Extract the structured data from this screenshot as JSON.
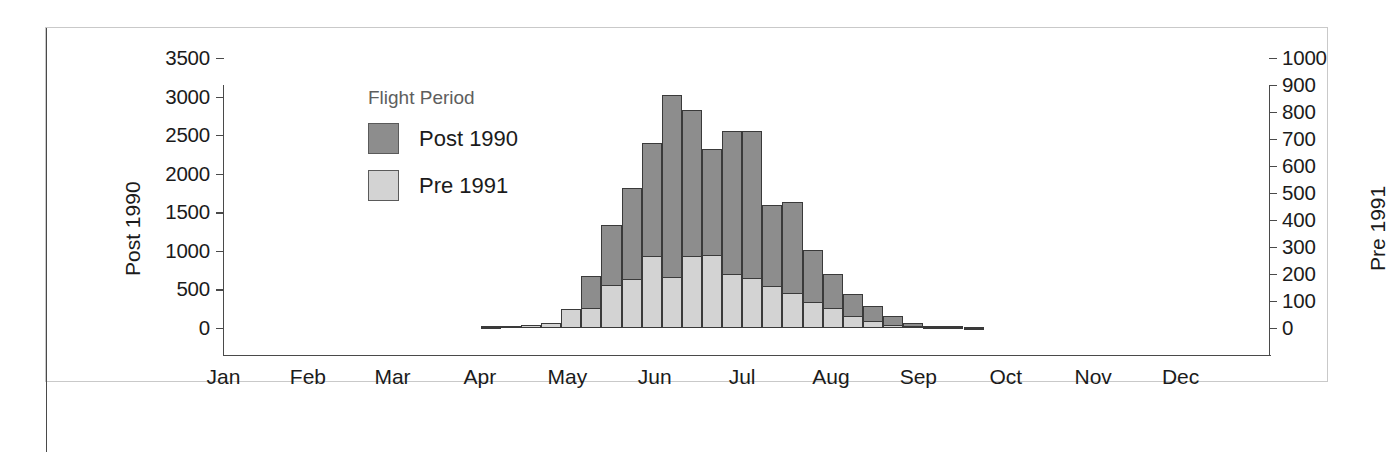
{
  "chart_data": {
    "type": "bar",
    "title": "",
    "subtitle": "",
    "legend": {
      "title": "Flight Period",
      "position": "inside-top-left",
      "entries": [
        {
          "name": "Post 1990",
          "color": "#8d8d8d"
        },
        {
          "name": "Pre 1991",
          "color": "#d3d3d3"
        }
      ]
    },
    "xlabel": "",
    "x_tick_labels": [
      "Jan",
      "Feb",
      "Mar",
      "Apr",
      "May",
      "Jun",
      "Jul",
      "Aug",
      "Sep",
      "Oct",
      "Nov",
      "Dec"
    ],
    "x_tick_count": 52,
    "grid": false,
    "axes": [
      {
        "side": "left",
        "label": "Post 1990",
        "ylim": [
          0,
          3500
        ],
        "ticks": [
          0,
          500,
          1000,
          1500,
          2000,
          2500,
          3000,
          3500
        ],
        "tick_labels": [
          "0",
          "500",
          "1000",
          "1500",
          "2000",
          "2500",
          "3000",
          "3500"
        ]
      },
      {
        "side": "right",
        "label": "Pre 1991",
        "ylim": [
          0,
          1000
        ],
        "ticks": [
          0,
          100,
          200,
          300,
          400,
          500,
          600,
          700,
          800,
          900,
          1000
        ],
        "tick_labels": [
          "0",
          "100",
          "200",
          "300",
          "400",
          "500",
          "600",
          "700",
          "800",
          "900",
          "1000"
        ]
      }
    ],
    "x": [
      "w1",
      "w2",
      "w3",
      "w4",
      "w5",
      "w6",
      "w7",
      "w8",
      "w9",
      "w10",
      "w11",
      "w12",
      "w13",
      "w14",
      "w15",
      "w16",
      "w17",
      "w18",
      "w19",
      "w20",
      "w21",
      "w22",
      "w23",
      "w24",
      "w25",
      "w26",
      "w27",
      "w28",
      "w29",
      "w30",
      "w31",
      "w32",
      "w33",
      "w34",
      "w35",
      "w36",
      "w37",
      "w38",
      "w39",
      "w40",
      "w41",
      "w42",
      "w43",
      "w44",
      "w45",
      "w46",
      "w47",
      "w48",
      "w49",
      "w50",
      "w51",
      "w52"
    ],
    "series": [
      {
        "name": "Post 1990",
        "axis": "left",
        "color": "#8d8d8d",
        "values": [
          0,
          0,
          0,
          0,
          0,
          0,
          0,
          0,
          0,
          0,
          0,
          0,
          0,
          0,
          0,
          25,
          30,
          40,
          60,
          240,
          680,
          1340,
          1810,
          2400,
          3020,
          2820,
          2320,
          2560,
          2560,
          1600,
          1630,
          1010,
          700,
          440,
          290,
          150,
          60,
          30,
          20,
          10,
          0,
          0,
          0,
          0,
          0,
          0,
          0,
          0,
          0,
          0,
          0,
          0
        ]
      },
      {
        "name": "Pre 1991",
        "axis": "right",
        "color": "#d3d3d3",
        "values": [
          0,
          0,
          0,
          0,
          0,
          0,
          0,
          0,
          0,
          0,
          0,
          0,
          0,
          0,
          0,
          5,
          8,
          12,
          18,
          70,
          75,
          160,
          180,
          265,
          190,
          265,
          270,
          200,
          185,
          155,
          130,
          95,
          75,
          45,
          25,
          12,
          6,
          3,
          2,
          1,
          0,
          0,
          0,
          0,
          0,
          0,
          0,
          0,
          0,
          0,
          0,
          0
        ]
      }
    ]
  }
}
